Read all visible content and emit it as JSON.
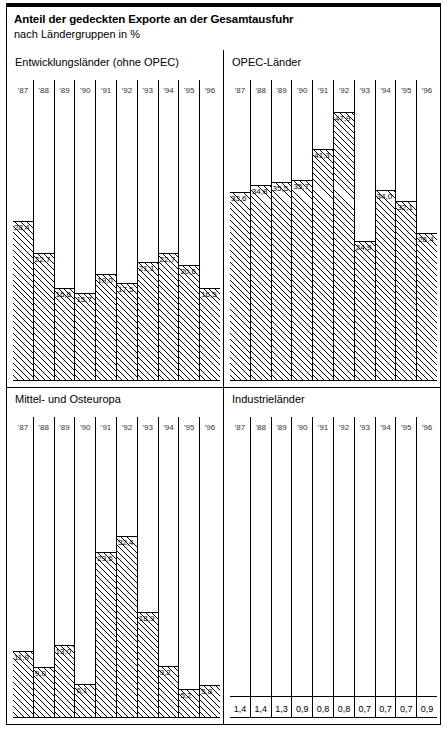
{
  "header": {
    "title": "Anteil der gedeckten Exporte an der Gesamtausfuhr",
    "subtitle": "nach Ländergruppen in %"
  },
  "chart_data": {
    "type": "bar",
    "title": "Anteil der gedeckten Exporte an der Gesamtausfuhr",
    "subtitle": "nach Ländergruppen in %",
    "xlabel": "",
    "ylabel": "%",
    "grid": false,
    "legend": "none",
    "decimal_separator": ",",
    "categories": [
      "'87",
      "'88",
      "'89",
      "'90",
      "'91",
      "'92",
      "'93",
      "'94",
      "'95",
      "'96"
    ],
    "panels": [
      {
        "name": "Entwicklungsländer (ohne OPEC)",
        "position": "top-left",
        "ylim": [
          0,
          50
        ],
        "categories": [
          "'87",
          "'88",
          "'89",
          "'90",
          "'91",
          "'92",
          "'93",
          "'94",
          "'95",
          "'96"
        ],
        "values": [
          28.4,
          22.7,
          16.6,
          15.7,
          19.0,
          17.5,
          21.1,
          22.7,
          20.6,
          16.5
        ],
        "labels": [
          "28,4",
          "22,7",
          "16,6",
          "15,7",
          "19,0",
          "17,5",
          "21,1",
          "22,7",
          "20,6",
          "16,5"
        ]
      },
      {
        "name": "OPEC-Länder",
        "position": "top-right",
        "ylim": [
          0,
          50
        ],
        "categories": [
          "'87",
          "'88",
          "'89",
          "'90",
          "'91",
          "'92",
          "'93",
          "'94",
          "'95",
          "'96"
        ],
        "values": [
          33.6,
          34.8,
          35.5,
          35.7,
          41.3,
          47.9,
          24.9,
          34.0,
          32.1,
          26.4
        ],
        "labels": [
          "33,6",
          "34,8",
          "35,5",
          "35,7",
          "41,3",
          "47,9",
          "24,9",
          "34,0",
          "32,1",
          "26,4"
        ]
      },
      {
        "name": "Mittel- und Osteuropa",
        "position": "bottom-left",
        "ylim": [
          0,
          50
        ],
        "categories": [
          "'87",
          "'88",
          "'89",
          "'90",
          "'91",
          "'92",
          "'93",
          "'94",
          "'95",
          "'96"
        ],
        "values": [
          11.9,
          9.0,
          13.0,
          6.1,
          29.6,
          32.4,
          18.9,
          9.2,
          5.2,
          5.8
        ],
        "labels": [
          "11,9",
          "9,0",
          "13,0",
          "6,1",
          "29,6",
          "32,4",
          "18,9",
          "9,2",
          "5,2",
          "5,8"
        ]
      },
      {
        "name": "Industrieländer",
        "position": "bottom-right",
        "ylim": [
          0,
          50
        ],
        "categories": [
          "'87",
          "'88",
          "'89",
          "'90",
          "'91",
          "'92",
          "'93",
          "'94",
          "'95",
          "'96"
        ],
        "values": [
          1.4,
          1.4,
          1.3,
          0.9,
          0.8,
          0.8,
          0.7,
          0.7,
          0.7,
          0.9
        ],
        "labels": [
          "1,4",
          "1,4",
          "1,3",
          "0,9",
          "0,8",
          "0,8",
          "0,7",
          "0,7",
          "0,7",
          "0,9"
        ]
      }
    ]
  }
}
